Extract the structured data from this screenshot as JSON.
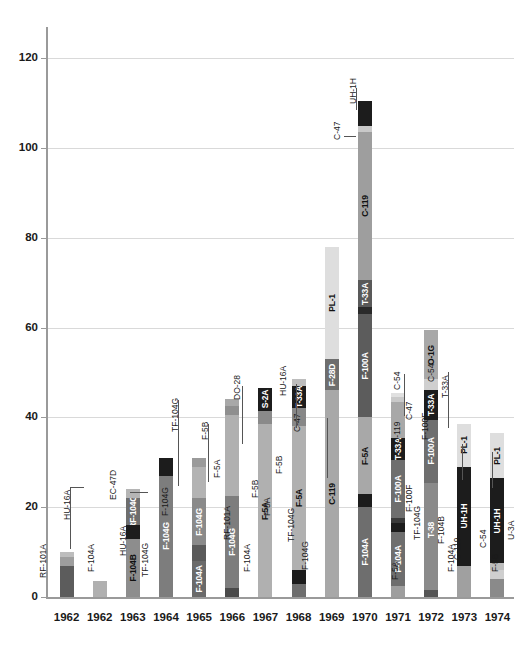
{
  "chart_data": {
    "type": "bar",
    "stacked": true,
    "title": "",
    "xlabel": "",
    "ylabel": "",
    "ylim": [
      0,
      130
    ],
    "yticks": [
      0,
      20,
      40,
      60,
      80,
      100,
      120
    ],
    "grid": true,
    "legend": "none",
    "categories": [
      "1962",
      "1962",
      "1963",
      "1964",
      "1965",
      "1966",
      "1967",
      "1968",
      "1969",
      "1970",
      "1971",
      "1972",
      "1973",
      "1974"
    ],
    "totals": [
      10,
      3.5,
      24,
      31,
      31,
      44,
      46.5,
      48.5,
      78,
      110.5,
      45.5,
      59.5,
      38.5,
      36.5
    ],
    "bars": [
      {
        "year": "1962",
        "total": 10,
        "segments": [
          {
            "label": "F-104A",
            "value": 7,
            "color": "#5c5c5c",
            "inside": false
          },
          {
            "label": "RF-101A",
            "value": 2,
            "color": "#9e9e9e",
            "inside": false
          },
          {
            "label": "HU-16A",
            "value": 1,
            "color": "#bdbdbd",
            "inside": false
          }
        ],
        "callouts": [
          "RF-101A",
          "HU-16A",
          "F-104A"
        ]
      },
      {
        "year": "1962",
        "total": 3.5,
        "segments": [
          {
            "label": "HU-16A",
            "value": 3.5,
            "color": "#b0b0b0",
            "inside": false
          }
        ],
        "callouts": [
          "HU-16A"
        ]
      },
      {
        "year": "1963",
        "total": 24,
        "segments": [
          {
            "label": "F-104B",
            "value": 13,
            "color": "#8d8d8d",
            "inside": true
          },
          {
            "label": "TF-104G",
            "value": 3,
            "color": "#1c1c1c",
            "inside": false
          },
          {
            "label": "RF-104G",
            "value": 6,
            "color": "#6e6e6e",
            "inside": true
          },
          {
            "label": "EC-47D",
            "value": 2,
            "color": "#b5b5b5",
            "inside": false
          }
        ],
        "callouts": [
          "EC-47D",
          "F-104G",
          "TF-104G"
        ]
      },
      {
        "year": "1964",
        "total": 31,
        "segments": [
          {
            "label": "F-104G",
            "value": 27,
            "color": "#7d7d7d",
            "inside": true
          },
          {
            "label": "TF-104G",
            "value": 4,
            "color": "#1c1c1c",
            "inside": false
          }
        ],
        "callouts": [
          "TF-104G"
        ]
      },
      {
        "year": "1965",
        "total": 31,
        "segments": [
          {
            "label": "F-104A",
            "value": 8,
            "color": "#6a6a6a",
            "inside": true
          },
          {
            "label": "RF-101A",
            "value": 3.5,
            "color": "#5a5a5a",
            "inside": false
          },
          {
            "label": "F-104G",
            "value": 10.5,
            "color": "#8a8a8a",
            "inside": true
          },
          {
            "label": "F-5A",
            "value": 7,
            "color": "#b3b3b3",
            "inside": false
          },
          {
            "label": "F-5B",
            "value": 2,
            "color": "#9a9a9a",
            "inside": false
          }
        ],
        "callouts": [
          "F-5B",
          "F-5A",
          "RF-101A"
        ]
      },
      {
        "year": "1966",
        "total": 44,
        "segments": [
          {
            "label": "F-104A",
            "value": 2,
            "color": "#4a4a4a",
            "inside": false
          },
          {
            "label": "F-104G",
            "value": 20.5,
            "color": "#7d7d7d",
            "inside": true
          },
          {
            "label": "F-5A",
            "value": 18,
            "color": "#b0b0b0",
            "inside": false
          },
          {
            "label": "F-5B",
            "value": 2,
            "color": "#8f8f8f",
            "inside": false
          },
          {
            "label": "C-119",
            "value": 1.5,
            "color": "#a8a8a8",
            "inside": true
          }
        ],
        "callouts": [
          "DO-28",
          "C-119",
          "F-5B",
          "F-5A",
          "F-104A"
        ]
      },
      {
        "year": "1967",
        "total": 46.5,
        "segments": [
          {
            "label": "F-5A",
            "value": 38.5,
            "color": "#b0b0b0",
            "inside": true
          },
          {
            "label": "F-5B",
            "value": 3,
            "color": "#8a8a8a",
            "inside": false
          },
          {
            "label": "S-2A",
            "value": 5,
            "color": "#1c1c1c",
            "inside": true
          }
        ],
        "callouts": [
          "S-2A",
          "F-5B"
        ]
      },
      {
        "year": "1968",
        "total": 48.5,
        "segments": [
          {
            "label": "F-104G",
            "value": 3,
            "color": "#6e6e6e",
            "inside": false
          },
          {
            "label": "TF-104G",
            "value": 3,
            "color": "#1c1c1c",
            "inside": false
          },
          {
            "label": "F-5A",
            "value": 32,
            "color": "#b0b0b0",
            "inside": true
          },
          {
            "label": "F-5B",
            "value": 4,
            "color": "#878787",
            "inside": true
          },
          {
            "label": "T-33A",
            "value": 5,
            "color": "#1c1c1c",
            "inside": true
          },
          {
            "label": "C-47",
            "value": 1.5,
            "color": "#bdbdbd",
            "inside": false
          }
        ],
        "callouts": [
          "HU-16A",
          "C-47",
          "TF-104G",
          "F-104G"
        ]
      },
      {
        "year": "1969",
        "total": 78,
        "segments": [
          {
            "label": "C-119",
            "value": 46,
            "color": "#a8a8a8",
            "inside": true
          },
          {
            "label": "F-28D",
            "value": 7,
            "color": "#6e6e6e",
            "inside": true
          },
          {
            "label": "PL-1",
            "value": 25,
            "color": "#dedede",
            "inside": true
          }
        ],
        "callouts": []
      },
      {
        "year": "1970",
        "total": 110.5,
        "segments": [
          {
            "label": "F-104A",
            "value": 20,
            "color": "#6e6e6e",
            "inside": true
          },
          {
            "label": "TF-104G",
            "value": 3,
            "color": "#1c1c1c",
            "inside": false
          },
          {
            "label": "F-5A",
            "value": 17,
            "color": "#a8a8a8",
            "inside": true
          },
          {
            "label": "F-100A",
            "value": 23,
            "color": "#5c5c5c",
            "inside": true
          },
          {
            "label": "F-5B",
            "value": 1.5,
            "color": "#2a2a2a",
            "inside": false
          },
          {
            "label": "T-33A",
            "value": 6,
            "color": "#595959",
            "inside": true
          },
          {
            "label": "C-119",
            "value": 33,
            "color": "#9e9e9e",
            "inside": true
          },
          {
            "label": "C-47",
            "value": 1.5,
            "color": "#c9c9c9",
            "inside": false
          },
          {
            "label": "UH-1H",
            "value": 5.5,
            "color": "#1c1c1c",
            "inside": false
          }
        ],
        "callouts": [
          "UH-1H",
          "C-47"
        ]
      },
      {
        "year": "1971",
        "total": 45.5,
        "segments": [
          {
            "label": "F-5A",
            "value": 2.5,
            "color": "#9e9e9e",
            "inside": false
          },
          {
            "label": "F-104A",
            "value": 12,
            "color": "#6e6e6e",
            "inside": true
          },
          {
            "label": "TF-104G",
            "value": 2,
            "color": "#1c1c1c",
            "inside": false
          },
          {
            "label": "F-100F",
            "value": 1,
            "color": "#3a3a3a",
            "inside": false
          },
          {
            "label": "F-100A",
            "value": 13,
            "color": "#6e6e6e",
            "inside": true
          },
          {
            "label": "T-33A",
            "value": 5,
            "color": "#1c1c1c",
            "inside": true
          },
          {
            "label": "C-119",
            "value": 8,
            "color": "#a8a8a8",
            "inside": false
          },
          {
            "label": "C-47",
            "value": 1,
            "color": "#c9c9c9",
            "inside": false
          },
          {
            "label": "C-54",
            "value": 1,
            "color": "#e0e0e0",
            "inside": false
          }
        ],
        "callouts": [
          "C-54",
          "C-47",
          "C-119",
          "F-100F",
          "TF-104G",
          "F-5A"
        ]
      },
      {
        "year": "1972",
        "total": 59.5,
        "segments": [
          {
            "label": "F-104A",
            "value": 1.5,
            "color": "#555555",
            "inside": false
          },
          {
            "label": "F-104B",
            "value": 3,
            "color": "#8a8a8a",
            "inside": false
          },
          {
            "label": "T-38",
            "value": 21,
            "color": "#8a8a8a",
            "inside": true
          },
          {
            "label": "F-100A",
            "value": 14,
            "color": "#6e6e6e",
            "inside": true
          },
          {
            "label": "T-33A",
            "value": 6.5,
            "color": "#1c1c1c",
            "inside": true
          },
          {
            "label": "C-54",
            "value": 2.5,
            "color": "#cfcfcf",
            "inside": false
          },
          {
            "label": "O-1G",
            "value": 11,
            "color": "#a8a8a8",
            "inside": true
          }
        ],
        "callouts": [
          "O-1G",
          "C-54",
          "T-33A",
          "F-100F",
          "F-104B",
          "F-104A"
        ]
      },
      {
        "year": "1973",
        "total": 38.5,
        "segments": [
          {
            "label": "C-119",
            "value": 7,
            "color": "#a0a0a0",
            "inside": false
          },
          {
            "label": "UH-1H",
            "value": 22,
            "color": "#1c1c1c",
            "inside": true
          },
          {
            "label": "PL-1",
            "value": 9.5,
            "color": "#dedede",
            "inside": true
          }
        ],
        "callouts": [
          "PL-1",
          "C-119",
          "F-104A"
        ]
      },
      {
        "year": "1974",
        "total": 36.5,
        "segments": [
          {
            "label": "F-5B",
            "value": 4,
            "color": "#8a8a8a",
            "inside": false
          },
          {
            "label": "C-54",
            "value": 2,
            "color": "#cfcfcf",
            "inside": false
          },
          {
            "label": "U-3A",
            "value": 1.5,
            "color": "#bdbdbd",
            "inside": false
          },
          {
            "label": "UH-1H",
            "value": 19,
            "color": "#1c1c1c",
            "inside": true
          },
          {
            "label": "PL-1",
            "value": 10,
            "color": "#dedede",
            "inside": true
          }
        ],
        "callouts": [
          "PL-1",
          "U-3A",
          "C-54",
          "F-5B"
        ]
      }
    ]
  },
  "axis": {
    "ylabels": [
      "0",
      "20",
      "40",
      "60",
      "80",
      "100",
      "120"
    ]
  }
}
